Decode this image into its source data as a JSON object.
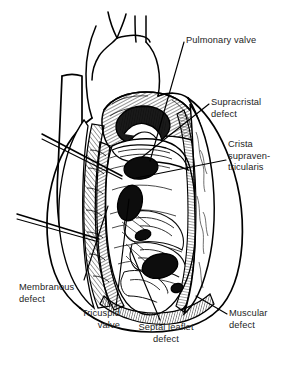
{
  "figure": {
    "kind": "anatomical-line-drawing",
    "background_color": "#ffffff",
    "ink_color": "#000000",
    "text_color": "#242424"
  },
  "labels": [
    {
      "id": "pulmonary-valve",
      "lines": [
        "Pulmonary valve"
      ],
      "x": 186,
      "y": 35,
      "align": "left",
      "leader": [
        [
          184,
          42
        ],
        [
          150,
          161
        ]
      ]
    },
    {
      "id": "supracristal-defect",
      "lines": [
        "Supracristal",
        "defect"
      ],
      "x": 211,
      "y": 97,
      "align": "left",
      "leader": [
        [
          209,
          104
        ],
        [
          141,
          158
        ]
      ]
    },
    {
      "id": "crista-supraventricularis",
      "lines": [
        "Crista",
        "supraven-",
        "tricularis"
      ],
      "x": 228,
      "y": 139,
      "align": "left",
      "leader": [
        [
          226,
          160
        ],
        [
          136,
          178
        ]
      ]
    },
    {
      "id": "membranous-defect",
      "lines": [
        "Membranous",
        "defect"
      ],
      "x": 19,
      "y": 282,
      "align": "left",
      "leader": [
        [
          84,
          280
        ],
        [
          108,
          206
        ]
      ]
    },
    {
      "id": "tricuspid-valve",
      "lines": [
        "Tricuspid",
        "valve"
      ],
      "x": 64,
      "y": 308,
      "align": "right",
      "width": 56,
      "leader": [
        [
          116,
          307
        ],
        [
          129,
          199
        ]
      ]
    },
    {
      "id": "septal-leaflet-defect",
      "lines": [
        "Septal leaflet",
        "defect"
      ],
      "x": 131,
      "y": 322,
      "align": "center",
      "width": 70,
      "leader": [
        [
          160,
          320
        ],
        [
          130,
          248
        ]
      ]
    },
    {
      "id": "muscular-defect",
      "lines": [
        "Muscular",
        "defect"
      ],
      "x": 229,
      "y": 308,
      "align": "left",
      "leader": [
        [
          227,
          314
        ],
        [
          196,
          296
        ]
      ]
    }
  ],
  "probes": [
    {
      "id": "upper-probe",
      "from": [
        42,
        134
      ],
      "to": [
        122,
        176
      ]
    },
    {
      "id": "lower-probe",
      "from": [
        17,
        214
      ],
      "to": [
        99,
        239
      ]
    }
  ],
  "defects": [
    {
      "id": "supracristal-opening",
      "cx": 141,
      "cy": 168,
      "rx": 17,
      "ry": 11,
      "rotation": -8
    },
    {
      "id": "membranous-opening",
      "cx": 130,
      "cy": 203,
      "rx": 12,
      "ry": 17,
      "rotation": 12
    },
    {
      "id": "septal-leaflet-opening",
      "cx": 160,
      "cy": 266,
      "rx": 18,
      "ry": 12,
      "rotation": -14
    },
    {
      "id": "small-opening-a",
      "cx": 143,
      "cy": 235,
      "rx": 8,
      "ry": 5,
      "rotation": -18
    },
    {
      "id": "pulmonary-valve-lumen",
      "cx": 143,
      "cy": 125,
      "rx": 26,
      "ry": 19,
      "rotation": -4
    }
  ]
}
